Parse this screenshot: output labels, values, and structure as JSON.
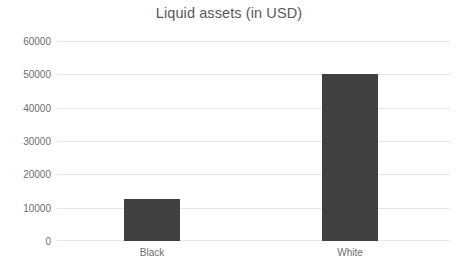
{
  "chart_data": {
    "type": "bar",
    "title": "Liquid assets (in USD)",
    "xlabel": "",
    "ylabel": "",
    "categories": [
      "Black",
      "White"
    ],
    "values": [
      12500,
      50000
    ],
    "series": [
      {
        "name": "Liquid assets (in USD)",
        "values": [
          12500,
          50000
        ]
      }
    ],
    "ylim": [
      0,
      60000
    ],
    "ytick_labels": [
      "0",
      "10000",
      "20000",
      "30000",
      "40000",
      "50000",
      "60000"
    ],
    "ytick_values": [
      0,
      10000,
      20000,
      30000,
      40000,
      50000,
      60000
    ],
    "grid": "horizontal",
    "legend": "none",
    "bar_color": "#404040",
    "gridline_color": "#e6e6e6",
    "title_color": "#595959",
    "tick_label_color": "#6d6d6d",
    "background_color": "#ffffff"
  }
}
